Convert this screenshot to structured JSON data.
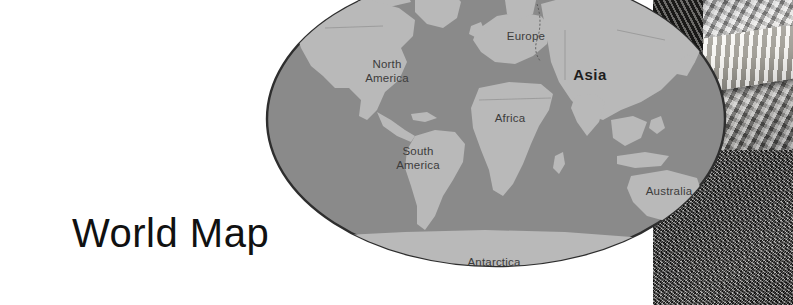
{
  "page": {
    "title": "World Map",
    "background_color": "#ffffff"
  },
  "map": {
    "name": "world-map",
    "projection_shape": "ellipse",
    "ocean_color": "#8a8a8a",
    "land_color": "#b9b9b9",
    "outline_color": "#2e2e2e",
    "label_color": "#3c3c3c",
    "emphasis_label_color": "#1e1e1e",
    "labels": [
      {
        "id": "north-america",
        "text": "North America",
        "lines": [
          "North",
          "America"
        ],
        "x": 122,
        "y": 103,
        "emphasis": false
      },
      {
        "id": "south-america",
        "text": "South America",
        "lines": [
          "South",
          "America"
        ],
        "x": 153,
        "y": 190,
        "emphasis": false
      },
      {
        "id": "europe",
        "text": "Europe",
        "lines": [
          "Europe"
        ],
        "x": 261,
        "y": 66,
        "emphasis": false
      },
      {
        "id": "africa",
        "text": "Africa",
        "lines": [
          "Africa"
        ],
        "x": 245,
        "y": 148,
        "emphasis": false
      },
      {
        "id": "asia",
        "text": "Asia",
        "lines": [
          "Asia"
        ],
        "x": 325,
        "y": 106,
        "emphasis": true
      },
      {
        "id": "australia",
        "text": "Australia",
        "lines": [
          "Australia"
        ],
        "x": 404,
        "y": 221,
        "emphasis": false
      },
      {
        "id": "antarctica",
        "text": "Antarctica",
        "lines": [
          "Antarctica"
        ],
        "x": 229,
        "y": 292,
        "emphasis": false
      }
    ]
  },
  "photo": {
    "subjects": [
      "snake",
      "gravel-ground"
    ]
  }
}
